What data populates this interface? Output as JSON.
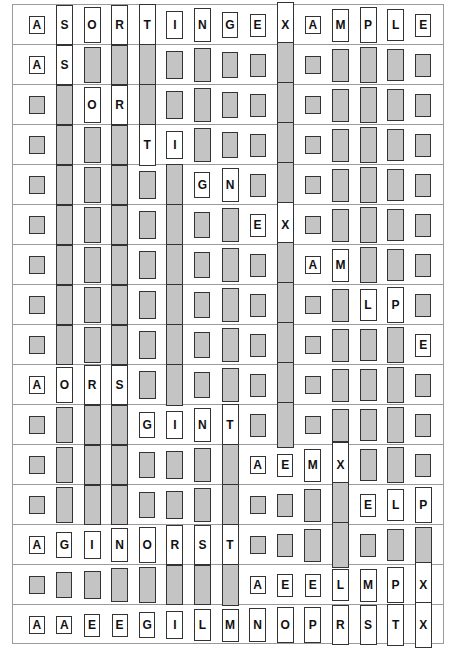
{
  "diagram": {
    "keys": [
      "A",
      "S",
      "O",
      "R",
      "T",
      "I",
      "N",
      "G",
      "E",
      "X",
      "A",
      "M",
      "P",
      "L",
      "E"
    ],
    "colors": {
      "active_fill": "#ffffff",
      "inactive_fill": "#c4c4c4",
      "border": "#333333",
      "row_divider": "#9a9a9a"
    },
    "rows": [
      {
        "items": [
          "A",
          "S",
          "O",
          "R",
          "T",
          "I",
          "N",
          "G",
          "E",
          "X",
          "A",
          "M",
          "P",
          "L",
          "E"
        ],
        "active": [
          0,
          1,
          2,
          3,
          4,
          5,
          6,
          7,
          8,
          9,
          10,
          11,
          12,
          13,
          14
        ]
      },
      {
        "items": [
          "A",
          "S",
          "O",
          "R",
          "T",
          "I",
          "N",
          "G",
          "E",
          "X",
          "A",
          "M",
          "P",
          "L",
          "E"
        ],
        "active": [
          0,
          1
        ]
      },
      {
        "items": [
          "A",
          "S",
          "O",
          "R",
          "T",
          "I",
          "N",
          "G",
          "E",
          "X",
          "A",
          "M",
          "P",
          "L",
          "E"
        ],
        "active": [
          2,
          3
        ]
      },
      {
        "items": [
          "A",
          "S",
          "O",
          "R",
          "T",
          "I",
          "N",
          "G",
          "E",
          "X",
          "A",
          "M",
          "P",
          "L",
          "E"
        ],
        "active": [
          4,
          5
        ]
      },
      {
        "items": [
          "A",
          "S",
          "O",
          "R",
          "I",
          "T",
          "G",
          "N",
          "E",
          "X",
          "A",
          "M",
          "P",
          "L",
          "E"
        ],
        "active": [
          6,
          7
        ]
      },
      {
        "items": [
          "A",
          "S",
          "O",
          "R",
          "I",
          "T",
          "G",
          "N",
          "E",
          "X",
          "A",
          "M",
          "P",
          "L",
          "E"
        ],
        "active": [
          8,
          9
        ]
      },
      {
        "items": [
          "A",
          "S",
          "O",
          "R",
          "I",
          "T",
          "G",
          "N",
          "E",
          "X",
          "A",
          "M",
          "P",
          "L",
          "E"
        ],
        "active": [
          10,
          11
        ]
      },
      {
        "items": [
          "A",
          "S",
          "O",
          "R",
          "I",
          "T",
          "G",
          "N",
          "E",
          "X",
          "A",
          "M",
          "L",
          "P",
          "E"
        ],
        "active": [
          12,
          13
        ]
      },
      {
        "items": [
          "A",
          "S",
          "O",
          "R",
          "I",
          "T",
          "G",
          "N",
          "E",
          "X",
          "A",
          "M",
          "L",
          "P",
          "E"
        ],
        "active": [
          14
        ]
      },
      {
        "items": [
          "A",
          "O",
          "R",
          "S",
          "I",
          "T",
          "G",
          "N",
          "E",
          "X",
          "A",
          "M",
          "L",
          "P",
          "E"
        ],
        "active": [
          0,
          1,
          2,
          3
        ]
      },
      {
        "items": [
          "A",
          "O",
          "R",
          "S",
          "G",
          "I",
          "N",
          "T",
          "E",
          "X",
          "A",
          "M",
          "L",
          "P",
          "E"
        ],
        "active": [
          4,
          5,
          6,
          7
        ]
      },
      {
        "items": [
          "A",
          "O",
          "R",
          "S",
          "G",
          "I",
          "N",
          "T",
          "A",
          "E",
          "M",
          "X",
          "L",
          "P",
          "E"
        ],
        "active": [
          8,
          9,
          10,
          11
        ]
      },
      {
        "items": [
          "A",
          "O",
          "R",
          "S",
          "G",
          "I",
          "N",
          "T",
          "A",
          "E",
          "M",
          "X",
          "E",
          "L",
          "P"
        ],
        "active": [
          12,
          13,
          14
        ]
      },
      {
        "items": [
          "A",
          "G",
          "I",
          "N",
          "O",
          "R",
          "S",
          "T",
          "A",
          "E",
          "M",
          "X",
          "E",
          "L",
          "P"
        ],
        "active": [
          0,
          1,
          2,
          3,
          4,
          5,
          6,
          7
        ]
      },
      {
        "items": [
          "A",
          "G",
          "I",
          "N",
          "O",
          "R",
          "S",
          "T",
          "A",
          "E",
          "E",
          "L",
          "M",
          "P",
          "X"
        ],
        "active": [
          8,
          9,
          10,
          11,
          12,
          13,
          14
        ]
      },
      {
        "items": [
          "A",
          "A",
          "E",
          "E",
          "G",
          "I",
          "L",
          "M",
          "N",
          "O",
          "P",
          "R",
          "S",
          "T",
          "X"
        ],
        "active": [
          0,
          1,
          2,
          3,
          4,
          5,
          6,
          7,
          8,
          9,
          10,
          11,
          12,
          13,
          14
        ]
      }
    ]
  }
}
